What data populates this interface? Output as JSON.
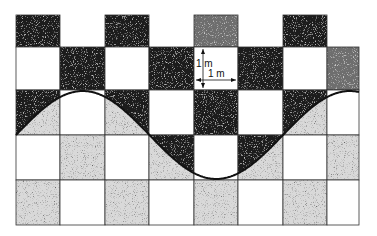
{
  "figure": {
    "annotations": [
      {
        "id": "vertical-dimension",
        "text": "1 m"
      },
      {
        "id": "horizontal-dimension",
        "text": "1 m"
      }
    ]
  },
  "grid": {
    "cell_size_m": 1,
    "columns_x": [
      16,
      60,
      105,
      149,
      194,
      238,
      283,
      327,
      359
    ],
    "rows_y": [
      15,
      47,
      90,
      135,
      180,
      225
    ],
    "fills": {
      "dark": "#1a1a1a",
      "medium": "#6e6e6e",
      "light": "#d9d9d9",
      "white": "#ffffff"
    },
    "rows": [
      [
        "dark",
        "none",
        "dark",
        "none",
        "medium",
        "none",
        "dark",
        "none"
      ],
      [
        "white",
        "dark",
        "white",
        "dark",
        "white",
        "dark",
        "white",
        "medium"
      ],
      [
        "split",
        "white",
        "split",
        "white",
        "dark",
        "white",
        "split",
        "white"
      ],
      [
        "white",
        "light",
        "white",
        "split",
        "white",
        "split",
        "white",
        "light"
      ],
      [
        "light",
        "white",
        "light",
        "white",
        "light",
        "white",
        "light",
        "white"
      ]
    ]
  },
  "wave": {
    "type": "sine",
    "midline_y": 135,
    "amplitude_px": 44,
    "period_px": 267,
    "x_start": 16,
    "x_end": 359,
    "color": "#111111"
  }
}
